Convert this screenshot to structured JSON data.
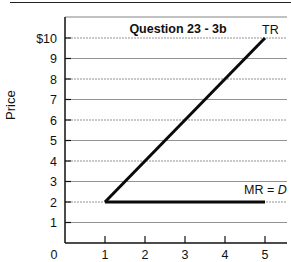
{
  "chart_data": {
    "type": "line",
    "title": "Question 23 - 3b",
    "xlabel": "",
    "ylabel": "Price",
    "xlim": [
      0,
      5.5
    ],
    "ylim": [
      0,
      10.8
    ],
    "x_ticks": [
      "0",
      "1",
      "2",
      "3",
      "4",
      "5"
    ],
    "y_ticks": [
      "1",
      "2",
      "3",
      "4",
      "5",
      "6",
      "7",
      "8",
      "9",
      "$10"
    ],
    "grid": true,
    "series": [
      {
        "name": "TR",
        "x": [
          1,
          5
        ],
        "y": [
          2,
          10
        ]
      },
      {
        "name": "MR = D",
        "x": [
          1,
          5
        ],
        "y": [
          2,
          2
        ]
      }
    ],
    "annotations": [
      {
        "text": "TR",
        "x": 5,
        "y": 10.3
      },
      {
        "text": "MR = D",
        "x": 4.6,
        "y": 2.5
      }
    ]
  },
  "labels": {
    "title": "Question 23 - 3b",
    "ylabel": "Price",
    "tr": "TR",
    "mr_prefix": "MR = ",
    "mr_italic": "D",
    "origin": "0"
  }
}
